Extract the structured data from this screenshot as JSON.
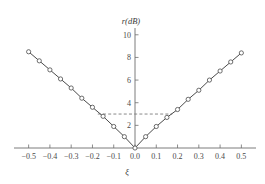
{
  "chart_data": {
    "type": "line",
    "title": "",
    "subtitle": "",
    "xlabel": "ξ",
    "ylabel": "r(dB)",
    "xlim": [
      -0.55,
      0.55
    ],
    "ylim": [
      0,
      10.6
    ],
    "grid": false,
    "legend": null,
    "x_ticks": [
      -0.5,
      -0.4,
      -0.3,
      -0.2,
      -0.1,
      0.0,
      0.1,
      0.2,
      0.3,
      0.4,
      0.5
    ],
    "x_tick_labels": [
      "−0.5",
      "−0.4",
      "−0.3",
      "−0.2",
      "−0.1",
      "0.0",
      "0.1",
      "0.2",
      "0.3",
      "0.4",
      "0.5"
    ],
    "y_ticks": [
      2,
      4,
      6,
      8,
      10
    ],
    "y_tick_labels": [
      "2",
      "4",
      "6",
      "8",
      "10"
    ],
    "marker": "open-circle",
    "series": [
      {
        "name": "r",
        "x": [
          -0.5,
          -0.45,
          -0.4,
          -0.35,
          -0.3,
          -0.25,
          -0.2,
          -0.15,
          -0.1,
          -0.05,
          0.0,
          0.05,
          0.1,
          0.15,
          0.2,
          0.25,
          0.3,
          0.35,
          0.4,
          0.45,
          0.5
        ],
        "values": [
          8.5,
          7.7,
          6.9,
          6.1,
          5.3,
          4.4,
          3.6,
          2.8,
          1.9,
          1.0,
          0.0,
          1.0,
          1.9,
          2.7,
          3.4,
          4.3,
          5.1,
          6.0,
          6.8,
          7.6,
          8.4
        ]
      }
    ],
    "annotations": [
      {
        "name": "three-db-reference",
        "type": "horizontal-dashed-line",
        "y": 3.0,
        "x_start": -0.175,
        "x_end": 0.175,
        "label": ""
      }
    ]
  },
  "axes": {
    "y_axis_title": "r(dB)",
    "x_axis_title": "ξ"
  },
  "colors": {
    "background": "#ffffff",
    "axis": "#6e6e6e",
    "series": "#4a4a4a",
    "reference": "#7d7d7d",
    "text": "#3a3a3a"
  }
}
